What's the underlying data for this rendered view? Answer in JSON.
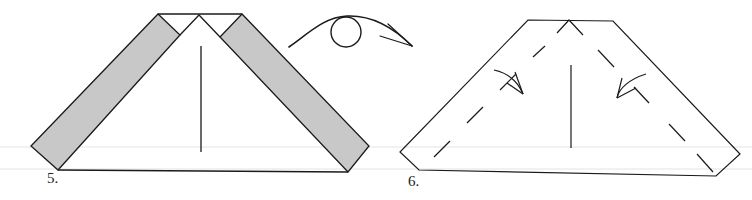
{
  "diagram": {
    "steps": [
      {
        "number": "5.",
        "description": "Strips folded down along both diagonal edges (shaded = colored side showing)"
      },
      {
        "number": "6.",
        "description": "Turn model over; valley-fold both sides along dashed lines in direction of arrows"
      }
    ],
    "turn_over_symbol": "turn-over-arrow",
    "colors": {
      "line": "#1a1a1a",
      "shade": "#c8c8c8",
      "background": "#ffffff"
    }
  }
}
